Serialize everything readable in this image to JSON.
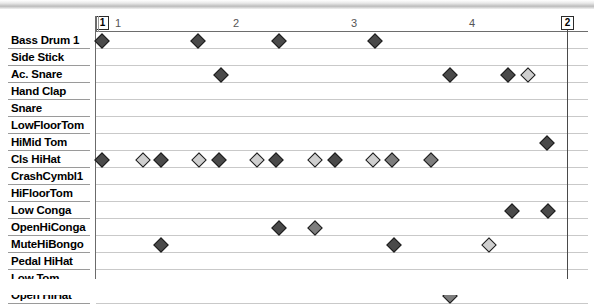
{
  "window": {
    "type": "midi-drum-editor",
    "width": 594,
    "height": 295
  },
  "colors": {
    "note_fill_high": "#4a4a4a",
    "note_fill_mid": "#7d7d7d",
    "note_fill_low": "#cfcfcf",
    "note_border": "#1c1c1c",
    "grid_line": "#c4c4c4",
    "beat_line": "#9e9e9e",
    "bar_line": "#6f6f6f",
    "header_text": "#5a5a5a",
    "label_text": "#000000",
    "background": "#ffffff"
  },
  "header": {
    "sound_column_label": "SOUND"
  },
  "ruler": {
    "bar_numbers": [
      "1",
      "2",
      "3",
      "4"
    ],
    "bar_positions_px": [
      102,
      220,
      338,
      456
    ],
    "start_marker_label": "1",
    "end_marker_label": "2",
    "start_marker_x": 99,
    "end_marker_x": 565
  },
  "grid": {
    "left_px": 96,
    "right_px": 588,
    "cell_width_px": 29.5,
    "row_height_px": 17,
    "columns": 16,
    "subdivisions_per_beat": 2
  },
  "rows": [
    {
      "label": "Bass Drum 1",
      "notes": [
        {
          "x": 102,
          "velocity": "high"
        },
        {
          "x": 198,
          "velocity": "high"
        },
        {
          "x": 279,
          "velocity": "high"
        },
        {
          "x": 375,
          "velocity": "high"
        }
      ]
    },
    {
      "label": "Side Stick",
      "notes": []
    },
    {
      "label": "Ac. Snare",
      "notes": [
        {
          "x": 221,
          "velocity": "high"
        },
        {
          "x": 450,
          "velocity": "high"
        },
        {
          "x": 508,
          "velocity": "high"
        },
        {
          "x": 528,
          "velocity": "low"
        }
      ]
    },
    {
      "label": "Hand Clap",
      "notes": []
    },
    {
      "label": "Snare",
      "notes": []
    },
    {
      "label": "LowFloorTom",
      "notes": []
    },
    {
      "label": "HiMid Tom",
      "notes": [
        {
          "x": 547,
          "velocity": "high"
        }
      ]
    },
    {
      "label": "Cls HiHat",
      "notes": [
        {
          "x": 102,
          "velocity": "high"
        },
        {
          "x": 143,
          "velocity": "low"
        },
        {
          "x": 161,
          "velocity": "high"
        },
        {
          "x": 199,
          "velocity": "low"
        },
        {
          "x": 219,
          "velocity": "high"
        },
        {
          "x": 257,
          "velocity": "low"
        },
        {
          "x": 276,
          "velocity": "high"
        },
        {
          "x": 315,
          "velocity": "low"
        },
        {
          "x": 335,
          "velocity": "high"
        },
        {
          "x": 373,
          "velocity": "low"
        },
        {
          "x": 392,
          "velocity": "mid"
        },
        {
          "x": 431,
          "velocity": "mid"
        }
      ]
    },
    {
      "label": "CrashCymbl1",
      "notes": []
    },
    {
      "label": "HiFloorTom",
      "notes": []
    },
    {
      "label": "Low Conga",
      "notes": [
        {
          "x": 512,
          "velocity": "high"
        },
        {
          "x": 548,
          "velocity": "high"
        }
      ]
    },
    {
      "label": "OpenHiConga",
      "notes": [
        {
          "x": 279,
          "velocity": "high"
        },
        {
          "x": 315,
          "velocity": "mid"
        }
      ]
    },
    {
      "label": "MuteHiBongo",
      "notes": [
        {
          "x": 161,
          "velocity": "high"
        },
        {
          "x": 394,
          "velocity": "high"
        },
        {
          "x": 489,
          "velocity": "low"
        }
      ]
    },
    {
      "label": "Pedal HiHat",
      "notes": []
    },
    {
      "label": "Low Tom",
      "notes": []
    },
    {
      "label": "Open HiHat",
      "notes": [
        {
          "x": 450,
          "velocity": "mid"
        }
      ]
    }
  ]
}
